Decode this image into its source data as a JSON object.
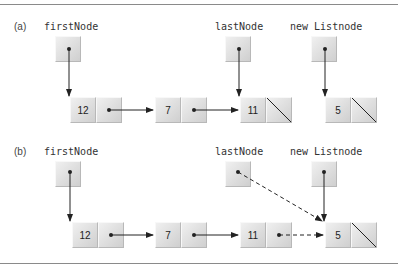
{
  "parts": [
    {
      "label": "(a)",
      "pointers": {
        "first": "firstNode",
        "last": "lastNode",
        "new": "new Listnode"
      },
      "nodes": [
        "12",
        "7",
        "11",
        "5"
      ]
    },
    {
      "label": "(b)",
      "pointers": {
        "first": "firstNode",
        "last": "lastNode",
        "new": "new Listnode"
      },
      "nodes": [
        "12",
        "7",
        "11",
        "5"
      ]
    }
  ],
  "colors": {
    "rule": "#8a8a8a",
    "box": "#dcdcdc",
    "arrow": "#222222"
  }
}
